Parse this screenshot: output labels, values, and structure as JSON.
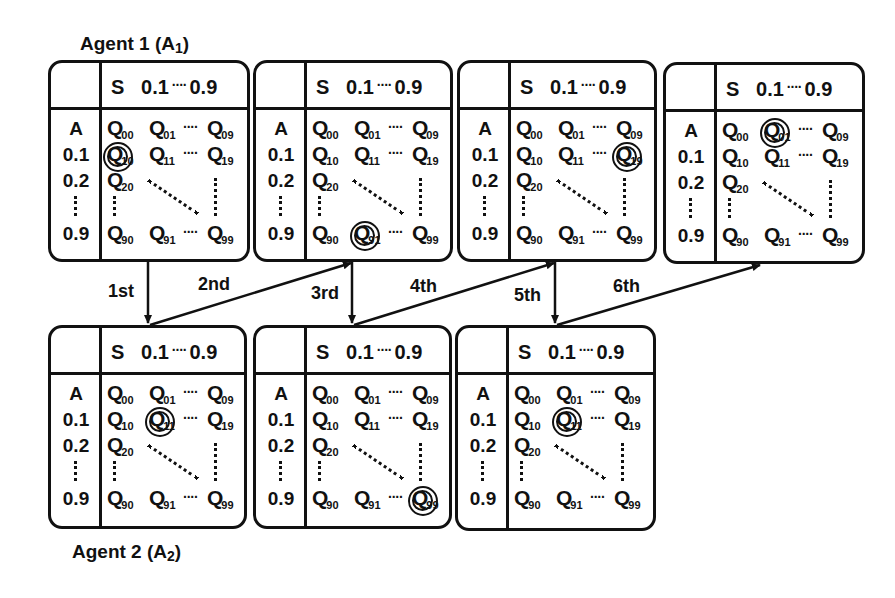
{
  "labels": {
    "agent1": {
      "text": "Agent 1 (A",
      "sub": "1",
      "close": ")"
    },
    "agent2": {
      "text": "Agent 2 (A",
      "sub": "2",
      "close": ")"
    }
  },
  "table": {
    "corner_row_label": "O",
    "corner_col_label": "T",
    "state_header": "S",
    "state_first": "0.1",
    "state_dots": "····",
    "state_last": "0.9",
    "action_header": "A",
    "action_rows": [
      "0.1",
      "0.2",
      "0.9"
    ],
    "q_symbol": "Q",
    "q_subscripts": {
      "r0": [
        "00",
        "01",
        "09"
      ],
      "r1": [
        "10",
        "11",
        "19"
      ],
      "r2": [
        "20"
      ],
      "r9": [
        "90",
        "91",
        "99"
      ]
    },
    "h_dots": "····"
  },
  "steps": [
    {
      "label": "1st",
      "from": "A1-panel1",
      "to": "A2-panel1"
    },
    {
      "label": "2nd",
      "from": "A2-panel1",
      "to": "A1-panel2"
    },
    {
      "label": "3rd",
      "from": "A1-panel2",
      "to": "A2-panel2"
    },
    {
      "label": "4th",
      "from": "A2-panel2",
      "to": "A1-panel3"
    },
    {
      "label": "5th",
      "from": "A1-panel3",
      "to": "A2-panel3"
    },
    {
      "label": "6th",
      "from": "A2-panel3",
      "to": "A1-panel4"
    }
  ],
  "panels": [
    {
      "id": "A1-panel1",
      "agent": "Agent 1",
      "highlighted": "Q10"
    },
    {
      "id": "A1-panel2",
      "agent": "Agent 1",
      "highlighted": "Q91"
    },
    {
      "id": "A1-panel3",
      "agent": "Agent 1",
      "highlighted": "Q19"
    },
    {
      "id": "A1-panel4",
      "agent": "Agent 1",
      "highlighted": "Q01"
    },
    {
      "id": "A2-panel1",
      "agent": "Agent 2",
      "highlighted": "Q11"
    },
    {
      "id": "A2-panel2",
      "agent": "Agent 2",
      "highlighted": "Q99"
    },
    {
      "id": "A2-panel3",
      "agent": "Agent 2",
      "highlighted": "Q11"
    }
  ],
  "colors": {
    "ink": "#111111",
    "background": "#ffffff"
  }
}
